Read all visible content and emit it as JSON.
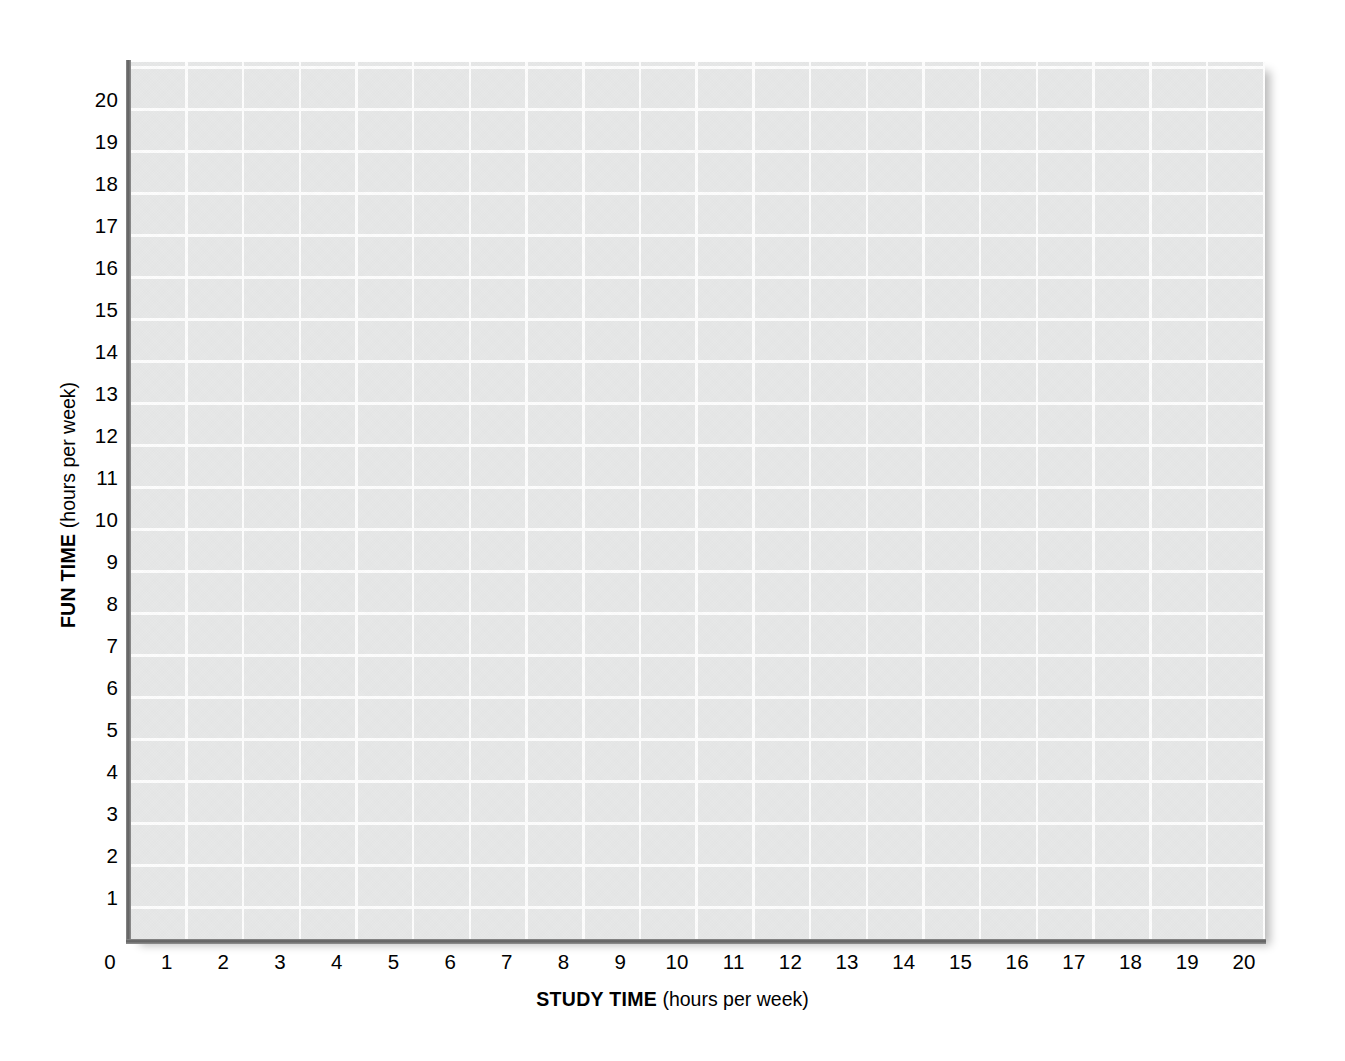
{
  "chart_data": {
    "type": "scatter",
    "title": "",
    "subtitle": "",
    "xlabel_bold": "STUDY TIME",
    "xlabel_light": " (hours per week)",
    "ylabel_bold": "FUN TIME",
    "ylabel_light": " (hours per week)",
    "xlabel_full": "STUDY TIME (hours per week)",
    "ylabel_full": "FUN TIME (hours per week)",
    "xlim": [
      0,
      20
    ],
    "ylim": [
      0,
      20.9
    ],
    "xticks": [
      "0",
      "1",
      "2",
      "3",
      "4",
      "5",
      "6",
      "7",
      "8",
      "9",
      "10",
      "11",
      "12",
      "13",
      "14",
      "15",
      "16",
      "17",
      "18",
      "19",
      "20"
    ],
    "yticks": [
      "1",
      "2",
      "3",
      "4",
      "5",
      "6",
      "7",
      "8",
      "9",
      "10",
      "11",
      "12",
      "13",
      "14",
      "15",
      "16",
      "17",
      "18",
      "19",
      "20"
    ],
    "xtick_values": [
      0,
      1,
      2,
      3,
      4,
      5,
      6,
      7,
      8,
      9,
      10,
      11,
      12,
      13,
      14,
      15,
      16,
      17,
      18,
      19,
      20
    ],
    "ytick_values": [
      1,
      2,
      3,
      4,
      5,
      6,
      7,
      8,
      9,
      10,
      11,
      12,
      13,
      14,
      15,
      16,
      17,
      18,
      19,
      20
    ],
    "grid": true,
    "grid_color": "#ffffff",
    "plot_background": "#e7e8e8",
    "axis_color": "#5e5e5e",
    "legend": null,
    "legend_position": "none",
    "series": [],
    "values": [],
    "annotations": []
  },
  "colors": {
    "page_background": "#ffffff",
    "cell_fill": "#e7e8e8",
    "gridline": "#fdfdfd",
    "axis_line": "#5e5e5e",
    "text": "#000000"
  }
}
